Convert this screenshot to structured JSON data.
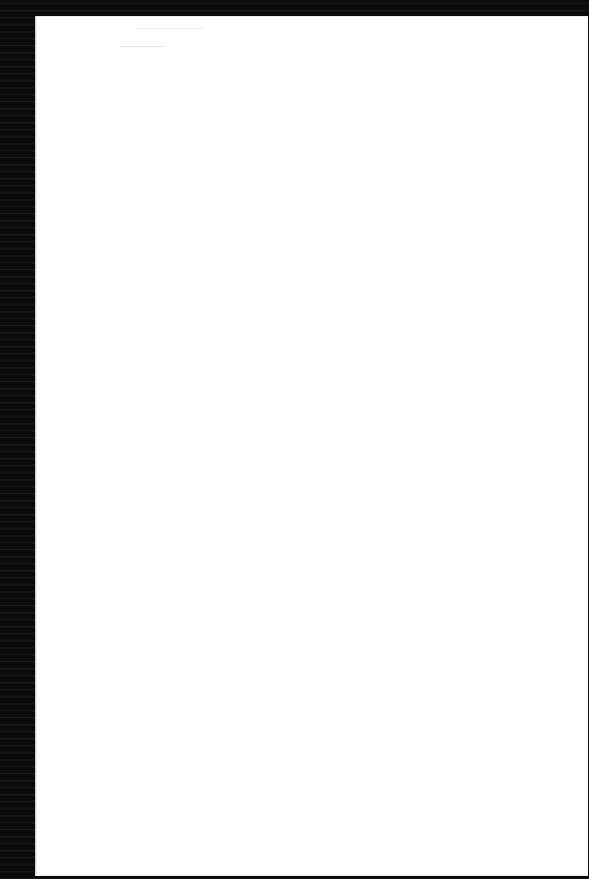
{
  "document": {
    "description": "Scanned blank page",
    "page_text": ""
  }
}
